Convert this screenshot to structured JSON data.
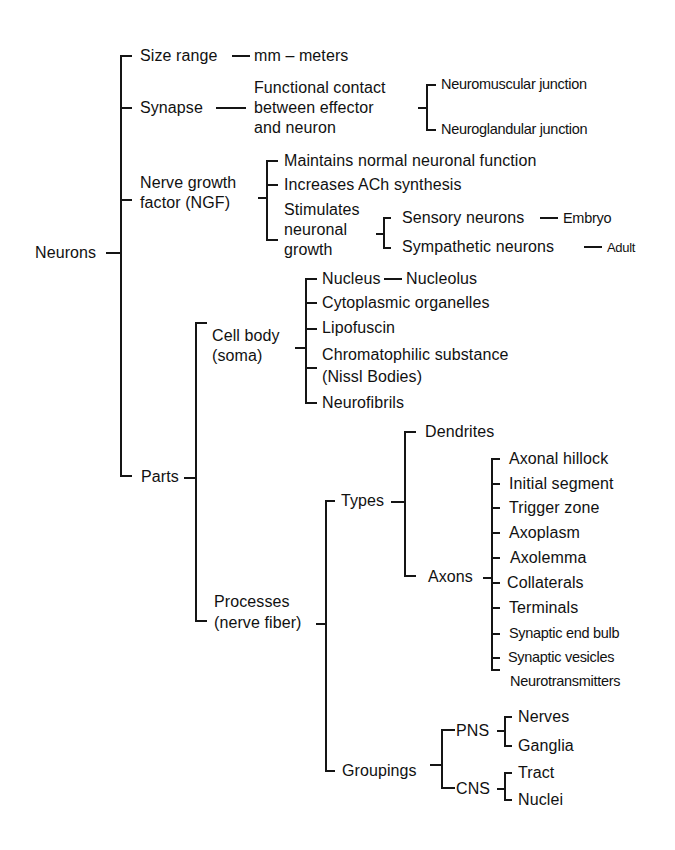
{
  "diagram": {
    "root": "Neurons",
    "size_range": {
      "label": "Size range",
      "value": "mm – meters"
    },
    "synapse": {
      "label": "Synapse",
      "definition": [
        "Functional  contact",
        "between effector",
        "and neuron"
      ],
      "children": [
        "Neuromuscular junction",
        "Neuroglandular junction"
      ]
    },
    "ngf": {
      "label": [
        "Nerve growth",
        "factor (NGF)"
      ],
      "children": [
        "Maintains normal neuronal function",
        "Increases ACh synthesis"
      ],
      "stimulates": {
        "label": [
          "Stimulates",
          "neuronal",
          "growth"
        ],
        "children": [
          {
            "label": "Sensory neurons",
            "value": "Embryo"
          },
          {
            "label": "Sympathetic neurons",
            "value": "Adult"
          }
        ]
      }
    },
    "parts": {
      "label": "Parts",
      "cell_body": {
        "label": [
          "Cell body",
          "(soma)"
        ],
        "nucleus": {
          "label": "Nucleus",
          "value": "Nucleolus"
        },
        "children": [
          "Cytoplasmic organelles",
          "Lipofuscin",
          "Chromatophilic substance",
          "(Nissl Bodies)",
          "Neurofibrils"
        ]
      },
      "processes": {
        "label": [
          "Processes",
          "(nerve fiber)"
        ],
        "types": {
          "label": "Types",
          "dendrites": "Dendrites",
          "axons": {
            "label": "Axons",
            "children": [
              "Axonal hillock",
              "Initial segment",
              "Trigger zone",
              "Axoplasm",
              "Axolemma",
              "Collaterals",
              "Terminals",
              "Synaptic end bulb",
              "Synaptic vesicles",
              "Neurotransmitters"
            ]
          }
        },
        "groupings": {
          "label": "Groupings",
          "pns": {
            "label": "PNS",
            "children": [
              "Nerves",
              "Ganglia"
            ]
          },
          "cns": {
            "label": "CNS",
            "children": [
              "Tract",
              "Nuclei"
            ]
          }
        }
      }
    }
  }
}
